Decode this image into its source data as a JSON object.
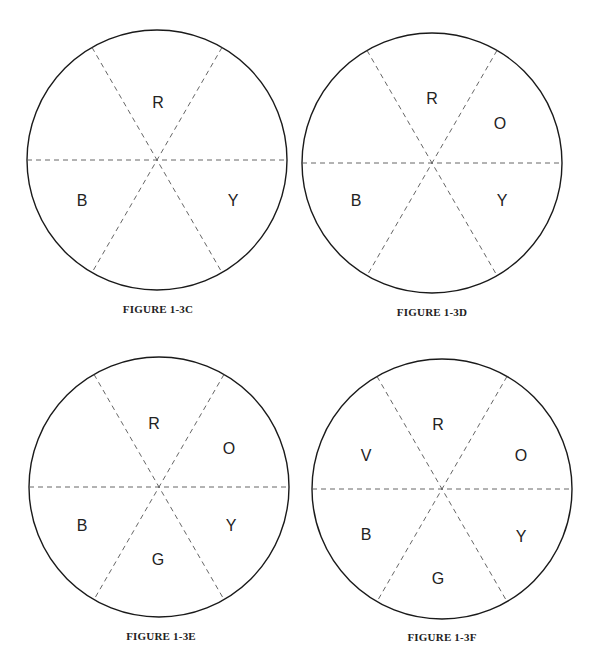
{
  "figures": [
    {
      "id": "c",
      "caption": "FIGURE 1-3C",
      "cx": 157,
      "cy": 160,
      "r": 130,
      "caption_x": 158,
      "caption_y": 303,
      "labels": [
        {
          "text": "R",
          "x": 158,
          "y": 104
        },
        {
          "text": "B",
          "x": 82,
          "y": 202
        },
        {
          "text": "Y",
          "x": 233,
          "y": 202
        }
      ]
    },
    {
      "id": "d",
      "caption": "FIGURE 1-3D",
      "cx": 432,
      "cy": 163,
      "r": 130,
      "caption_x": 432,
      "caption_y": 306,
      "labels": [
        {
          "text": "R",
          "x": 432,
          "y": 100
        },
        {
          "text": "O",
          "x": 500,
          "y": 125
        },
        {
          "text": "B",
          "x": 356,
          "y": 202
        },
        {
          "text": "Y",
          "x": 502,
          "y": 202
        }
      ]
    },
    {
      "id": "e",
      "caption": "FIGURE 1-3E",
      "cx": 159,
      "cy": 487,
      "r": 130,
      "caption_x": 161,
      "caption_y": 630,
      "labels": [
        {
          "text": "R",
          "x": 154,
          "y": 425
        },
        {
          "text": "O",
          "x": 229,
          "y": 450
        },
        {
          "text": "B",
          "x": 82,
          "y": 527
        },
        {
          "text": "Y",
          "x": 231,
          "y": 527
        },
        {
          "text": "G",
          "x": 158,
          "y": 561
        }
      ]
    },
    {
      "id": "f",
      "caption": "FIGURE 1-3F",
      "cx": 442,
      "cy": 489,
      "r": 130,
      "caption_x": 442,
      "caption_y": 631,
      "labels": [
        {
          "text": "R",
          "x": 438,
          "y": 426
        },
        {
          "text": "V",
          "x": 366,
          "y": 457
        },
        {
          "text": "O",
          "x": 521,
          "y": 457
        },
        {
          "text": "B",
          "x": 366,
          "y": 536
        },
        {
          "text": "Y",
          "x": 521,
          "y": 538
        },
        {
          "text": "G",
          "x": 438,
          "y": 580
        }
      ]
    }
  ],
  "colors": {
    "stroke": "#1a1a1a",
    "dash": "#555555",
    "text": "#222222"
  }
}
